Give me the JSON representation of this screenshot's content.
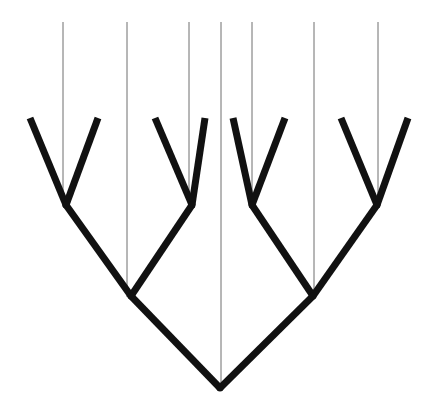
{
  "figure": {
    "width": 427,
    "height": 407,
    "background_color": "#ffffff"
  },
  "style": {
    "branch_color": "#111111",
    "branch_width": 7,
    "guide_color": "#6e6e6e",
    "guide_width": 1,
    "line_cap": "butt",
    "line_join": "miter"
  },
  "chart_data": {
    "type": "diagram",
    "subtype": "cladogram",
    "xlabel": "",
    "ylabel": "",
    "orientation": "root-at-bottom",
    "leaf_count": 8,
    "internal_node_count": 7,
    "guide_line_count": 7,
    "nodes": [
      {
        "id": "root",
        "label": "root",
        "x": 220,
        "y": 388,
        "kind": "internal"
      },
      {
        "id": "n-l",
        "label": "left-clade",
        "x": 131,
        "y": 296,
        "kind": "internal"
      },
      {
        "id": "n-r",
        "label": "right-clade",
        "x": 313,
        "y": 296,
        "kind": "internal"
      },
      {
        "id": "n-ll",
        "label": "pair-1",
        "x": 66,
        "y": 205,
        "kind": "internal"
      },
      {
        "id": "n-lr",
        "label": "pair-2",
        "x": 192,
        "y": 205,
        "kind": "internal"
      },
      {
        "id": "n-rl",
        "label": "pair-3",
        "x": 252,
        "y": 205,
        "kind": "internal"
      },
      {
        "id": "n-rr",
        "label": "pair-4",
        "x": 377,
        "y": 205,
        "kind": "internal"
      },
      {
        "id": "t1",
        "label": "taxon-1",
        "x": 30,
        "y": 118,
        "kind": "leaf"
      },
      {
        "id": "t2",
        "label": "taxon-2",
        "x": 98,
        "y": 118,
        "kind": "leaf"
      },
      {
        "id": "t3",
        "label": "taxon-3",
        "x": 155,
        "y": 118,
        "kind": "leaf"
      },
      {
        "id": "t4",
        "label": "taxon-4",
        "x": 205,
        "y": 118,
        "kind": "leaf"
      },
      {
        "id": "t5",
        "label": "taxon-5",
        "x": 233,
        "y": 118,
        "kind": "leaf"
      },
      {
        "id": "t6",
        "label": "taxon-6",
        "x": 285,
        "y": 118,
        "kind": "leaf"
      },
      {
        "id": "t7",
        "label": "taxon-7",
        "x": 341,
        "y": 118,
        "kind": "leaf"
      },
      {
        "id": "t8",
        "label": "taxon-8",
        "x": 408,
        "y": 118,
        "kind": "leaf"
      }
    ],
    "branches": [
      {
        "id": "b-root-left",
        "name": "root-to-left-clade",
        "from": "root",
        "to": "n-l",
        "x1": 220,
        "y1": 388,
        "x2": 131,
        "y2": 296
      },
      {
        "id": "b-root-right",
        "name": "root-to-right-clade",
        "from": "root",
        "to": "n-r",
        "x1": 220,
        "y1": 388,
        "x2": 313,
        "y2": 296
      },
      {
        "id": "b-l-ll",
        "name": "left-clade-to-pair-1",
        "from": "n-l",
        "to": "n-ll",
        "x1": 131,
        "y1": 296,
        "x2": 66,
        "y2": 205
      },
      {
        "id": "b-l-lr",
        "name": "left-clade-to-pair-2",
        "from": "n-l",
        "to": "n-lr",
        "x1": 131,
        "y1": 296,
        "x2": 192,
        "y2": 205
      },
      {
        "id": "b-r-rl",
        "name": "right-clade-to-pair-3",
        "from": "n-r",
        "to": "n-rl",
        "x1": 313,
        "y1": 296,
        "x2": 252,
        "y2": 205
      },
      {
        "id": "b-r-rr",
        "name": "right-clade-to-pair-4",
        "from": "n-r",
        "to": "n-rr",
        "x1": 313,
        "y1": 296,
        "x2": 377,
        "y2": 205
      },
      {
        "id": "b-ll-t1",
        "name": "pair-1-to-taxon-1",
        "from": "n-ll",
        "to": "t1",
        "x1": 66,
        "y1": 205,
        "x2": 30,
        "y2": 118
      },
      {
        "id": "b-ll-t2",
        "name": "pair-1-to-taxon-2",
        "from": "n-ll",
        "to": "t2",
        "x1": 66,
        "y1": 205,
        "x2": 98,
        "y2": 118
      },
      {
        "id": "b-lr-t3",
        "name": "pair-2-to-taxon-3",
        "from": "n-lr",
        "to": "t3",
        "x1": 192,
        "y1": 205,
        "x2": 155,
        "y2": 118
      },
      {
        "id": "b-lr-t4",
        "name": "pair-2-to-taxon-4",
        "from": "n-lr",
        "to": "t4",
        "x1": 192,
        "y1": 205,
        "x2": 205,
        "y2": 118
      },
      {
        "id": "b-rl-t5",
        "name": "pair-3-to-taxon-5",
        "from": "n-rl",
        "to": "t5",
        "x1": 252,
        "y1": 205,
        "x2": 233,
        "y2": 118
      },
      {
        "id": "b-rl-t6",
        "name": "pair-3-to-taxon-6",
        "from": "n-rl",
        "to": "t6",
        "x1": 252,
        "y1": 205,
        "x2": 285,
        "y2": 118
      },
      {
        "id": "b-rr-t7",
        "name": "pair-4-to-taxon-7",
        "from": "n-rr",
        "to": "t7",
        "x1": 377,
        "y1": 205,
        "x2": 341,
        "y2": 118
      },
      {
        "id": "b-rr-t8",
        "name": "pair-4-to-taxon-8",
        "from": "n-rr",
        "to": "t8",
        "x1": 377,
        "y1": 205,
        "x2": 408,
        "y2": 118
      }
    ],
    "guide_lines": [
      {
        "id": "g1",
        "name": "guide-line-1",
        "x": 63,
        "y_top": 22,
        "y_bottom": 207
      },
      {
        "id": "g2",
        "name": "guide-line-2",
        "x": 127,
        "y_top": 22,
        "y_bottom": 297
      },
      {
        "id": "g3",
        "name": "guide-line-3",
        "x": 189,
        "y_top": 22,
        "y_bottom": 207
      },
      {
        "id": "g4",
        "name": "guide-line-4",
        "x": 221,
        "y_top": 22,
        "y_bottom": 389
      },
      {
        "id": "g5",
        "name": "guide-line-5",
        "x": 252,
        "y_top": 22,
        "y_bottom": 207
      },
      {
        "id": "g6",
        "name": "guide-line-6",
        "x": 314,
        "y_top": 22,
        "y_bottom": 297
      },
      {
        "id": "g7",
        "name": "guide-line-7",
        "x": 378,
        "y_top": 22,
        "y_bottom": 207
      }
    ]
  }
}
